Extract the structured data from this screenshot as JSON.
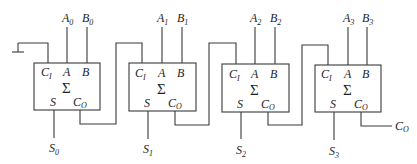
{
  "diagram": {
    "type": "4-bit ripple-carry adder",
    "block_symbol": "Σ",
    "cells": [
      {
        "index": 0,
        "a_label": "A",
        "a_sub": "0",
        "b_label": "B",
        "b_sub": "0",
        "s_label": "S",
        "s_sub": "0",
        "ports": {
          "ci": "C",
          "ci_sub": "I",
          "a": "A",
          "b": "B",
          "s": "S",
          "co": "C",
          "co_sub": "O"
        }
      },
      {
        "index": 1,
        "a_label": "A",
        "a_sub": "1",
        "b_label": "B",
        "b_sub": "1",
        "s_label": "S",
        "s_sub": "1",
        "ports": {
          "ci": "C",
          "ci_sub": "I",
          "a": "A",
          "b": "B",
          "s": "S",
          "co": "C",
          "co_sub": "O"
        }
      },
      {
        "index": 2,
        "a_label": "A",
        "a_sub": "2",
        "b_label": "B",
        "b_sub": "2",
        "s_label": "S",
        "s_sub": "2",
        "ports": {
          "ci": "C",
          "ci_sub": "I",
          "a": "A",
          "b": "B",
          "s": "S",
          "co": "C",
          "co_sub": "O"
        }
      },
      {
        "index": 3,
        "a_label": "A",
        "a_sub": "3",
        "b_label": "B",
        "b_sub": "3",
        "s_label": "S",
        "s_sub": "3",
        "ports": {
          "ci": "C",
          "ci_sub": "I",
          "a": "A",
          "b": "B",
          "s": "S",
          "co": "C",
          "co_sub": "O"
        }
      }
    ],
    "carry_in": {
      "connection": "ground"
    },
    "carry_out": {
      "label": "C",
      "sub": "O"
    },
    "colors": {
      "line": "#3a3a3a",
      "text": "#1e1e1e",
      "background": "#ffffff"
    }
  }
}
